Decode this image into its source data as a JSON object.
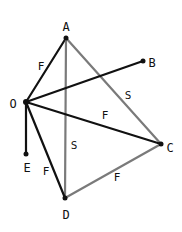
{
  "diagram": {
    "width": 182,
    "height": 232,
    "colors": {
      "black_edge": "#111111",
      "gray_edge": "#7a7a7a",
      "node": "#111111",
      "background": "#ffffff"
    },
    "nodes": [
      {
        "id": "A",
        "label": "A",
        "x": 66,
        "y": 38,
        "lx": 66,
        "ly": 27
      },
      {
        "id": "B",
        "label": "B",
        "x": 143,
        "y": 61,
        "lx": 152,
        "ly": 63
      },
      {
        "id": "O",
        "label": "O",
        "x": 26,
        "y": 102,
        "lx": 13,
        "ly": 104
      },
      {
        "id": "C",
        "label": "C",
        "x": 161,
        "y": 144,
        "lx": 170,
        "ly": 148
      },
      {
        "id": "E",
        "label": "E",
        "x": 26,
        "y": 154,
        "lx": 27,
        "ly": 168
      },
      {
        "id": "D",
        "label": "D",
        "x": 65,
        "y": 198,
        "lx": 66,
        "ly": 215
      }
    ],
    "edges": [
      {
        "from": "A",
        "to": "O",
        "label": "F",
        "color": "black",
        "lx": 41,
        "ly": 67
      },
      {
        "from": "A",
        "to": "D",
        "label": "S",
        "color": "gray",
        "lx": 74,
        "ly": 146
      },
      {
        "from": "A",
        "to": "C",
        "label": "S",
        "color": "gray",
        "lx": 128,
        "ly": 96
      },
      {
        "from": "O",
        "to": "B",
        "label": "",
        "color": "black"
      },
      {
        "from": "O",
        "to": "C",
        "label": "F",
        "color": "black",
        "lx": 105,
        "ly": 116
      },
      {
        "from": "O",
        "to": "E",
        "label": "",
        "color": "black"
      },
      {
        "from": "O",
        "to": "D",
        "label": "F",
        "color": "black",
        "lx": 46,
        "ly": 172
      },
      {
        "from": "D",
        "to": "C",
        "label": "F",
        "color": "gray",
        "lx": 117,
        "ly": 178
      }
    ]
  }
}
